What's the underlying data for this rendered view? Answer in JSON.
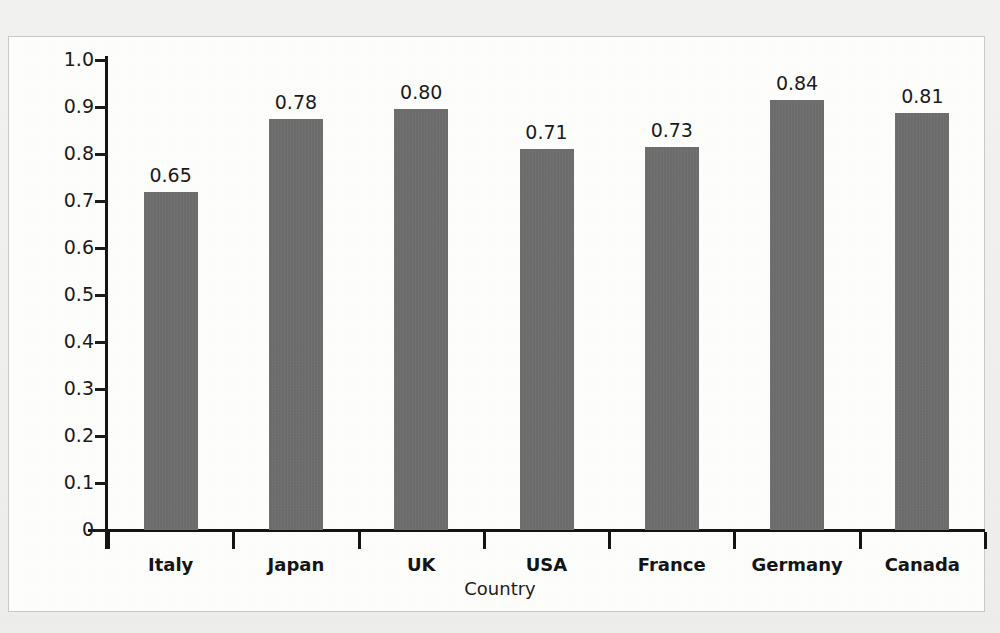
{
  "figure": {
    "panel_background": "#fdfdfc",
    "page_background": "#f1f1ef",
    "bar_color": "#6e6e6e",
    "axis_color": "#141414"
  },
  "chart_data": {
    "type": "bar",
    "title": "",
    "subtitle": "",
    "xlabel": "Country",
    "ylabel": "Index score",
    "categories": [
      "Italy",
      "Japan",
      "UK",
      "USA",
      "France",
      "Germany",
      "Canada"
    ],
    "values": [
      0.65,
      0.78,
      0.8,
      0.71,
      0.73,
      0.84,
      0.81
    ],
    "data_labels": [
      "0.65",
      "0.78",
      "0.80",
      "0.71",
      "0.73",
      "0.84",
      "0.81"
    ],
    "bar_top_positions": [
      0.72,
      0.875,
      0.895,
      0.81,
      0.815,
      0.915,
      0.888
    ],
    "ylim": [
      0,
      1.0
    ],
    "ytick_values": [
      0,
      0.1,
      0.2,
      0.3,
      0.4,
      0.5,
      0.6,
      0.7,
      0.8,
      0.9,
      1.0
    ],
    "ytick_labels": [
      "0",
      "0.1",
      "0.2",
      "0.3",
      "0.4",
      "0.5",
      "0.6",
      "0.7",
      "0.8",
      "0.9",
      "1.0"
    ],
    "grid": false,
    "legend": "none",
    "series": [
      {
        "name": "Index score",
        "values": [
          0.65,
          0.78,
          0.8,
          0.71,
          0.73,
          0.84,
          0.81
        ]
      }
    ]
  }
}
